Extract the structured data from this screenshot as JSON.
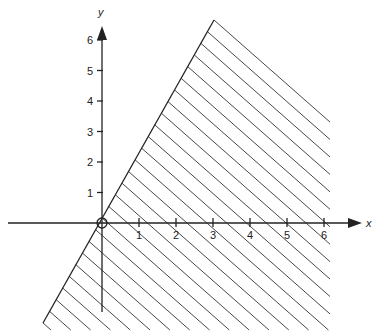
{
  "diagram": {
    "x_axis": {
      "label": "x",
      "ticks": [
        "1",
        "2",
        "3",
        "4",
        "5",
        "6"
      ]
    },
    "y_axis": {
      "label": "y",
      "ticks": [
        "1",
        "2",
        "3",
        "4",
        "5",
        "6"
      ]
    },
    "origin_marker": "circle-at-origin",
    "boundary": {
      "equation": "y = 2x",
      "style": "solid"
    },
    "shading": {
      "style": "diagonal-hatch",
      "side": "below-right of boundary"
    },
    "colors": {
      "line": "#222222",
      "background": "#ffffff"
    }
  }
}
